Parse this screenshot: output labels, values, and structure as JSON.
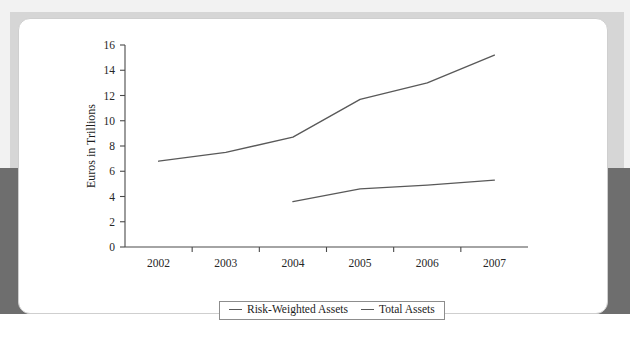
{
  "figure": {
    "card_label": "chart-card",
    "top_artifact_text": ""
  },
  "legend": {
    "position": "bottom-center",
    "items": [
      {
        "label": "Risk-Weighted Assets",
        "marker": "line-dash",
        "color": "#595959"
      },
      {
        "label": "Total Assets",
        "marker": "line-dash",
        "color": "#595959"
      }
    ]
  },
  "chart_data": {
    "type": "line",
    "title": "",
    "subtitle": "",
    "xlabel": "",
    "ylabel": "Euros in Trillions",
    "categories": [
      "2002",
      "2003",
      "2004",
      "2005",
      "2006",
      "2007"
    ],
    "x": [
      2002,
      2003,
      2004,
      2005,
      2006,
      2007
    ],
    "ylim": [
      0,
      16
    ],
    "yticks": [
      0,
      2,
      4,
      6,
      8,
      10,
      12,
      14,
      16
    ],
    "ytick_labels": [
      "0",
      "2",
      "4",
      "6",
      "8",
      "10",
      "12",
      "14",
      "16"
    ],
    "xtick_labels": [
      "2002",
      "2003",
      "2004",
      "2005",
      "2006",
      "2007"
    ],
    "grid": false,
    "tick_placement": "category-boundaries",
    "legend_position": "bottom-center",
    "series": [
      {
        "name": "Risk-Weighted Assets",
        "color": "#595959",
        "x": [
          2004,
          2005,
          2006,
          2007
        ],
        "values": [
          3.6,
          4.6,
          4.9,
          5.3
        ]
      },
      {
        "name": "Total Assets",
        "color": "#595959",
        "x": [
          2002,
          2003,
          2004,
          2005,
          2006,
          2007
        ],
        "values": [
          6.8,
          7.5,
          8.7,
          11.7,
          13.0,
          15.2
        ]
      }
    ]
  }
}
